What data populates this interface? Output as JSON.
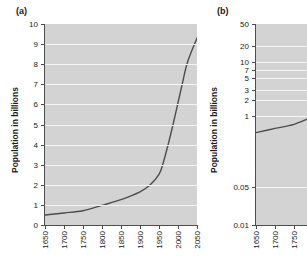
{
  "figure": {
    "panels": [
      {
        "key": "a",
        "label": "(a)",
        "ylabel": "Population in billions",
        "yscale": "linear"
      },
      {
        "key": "b",
        "label": "(b)",
        "ylabel": "Population in billions",
        "yscale": "log"
      }
    ]
  },
  "chart_data": [
    {
      "type": "line",
      "panel": "a",
      "title": "",
      "xlabel": "",
      "ylabel": "Population in billions",
      "xscale": "linear",
      "yscale": "linear",
      "xlim": [
        1650,
        2050
      ],
      "ylim": [
        0,
        10
      ],
      "xticks": [
        1650,
        1700,
        1750,
        1800,
        1850,
        1900,
        1950,
        2000,
        2050
      ],
      "xticklabels": [
        "1650",
        "1700",
        "1750",
        "1800",
        "1850",
        "1900",
        "1950",
        "2000",
        "2050"
      ],
      "yticks": [
        0,
        1,
        2,
        3,
        4,
        5,
        6,
        7,
        8,
        9,
        10
      ],
      "yticklabels": [
        "0",
        "1",
        "2",
        "3",
        "4",
        "5",
        "6",
        "7",
        "8",
        "9",
        "10"
      ],
      "grid": true,
      "grid_axis": "y",
      "legend": null,
      "series": [
        {
          "name": "World population",
          "color": "#4d4d4d",
          "x": [
            1650,
            1700,
            1750,
            1800,
            1850,
            1900,
            1927,
            1950,
            1960,
            1974,
            1987,
            1999,
            2011,
            2025,
            2050
          ],
          "y": [
            0.5,
            0.6,
            0.71,
            0.98,
            1.26,
            1.65,
            2.0,
            2.52,
            3.02,
            4.0,
            5.0,
            6.0,
            7.0,
            8.1,
            9.3
          ]
        }
      ]
    },
    {
      "type": "line",
      "panel": "b",
      "title": "",
      "xlabel": "",
      "ylabel": "Population in billions",
      "xscale": "linear",
      "yscale": "log",
      "xlim": [
        1650,
        2050
      ],
      "ylim": [
        0.01,
        50
      ],
      "xticks": [
        1650,
        1700,
        1750,
        1800,
        1850,
        1900,
        1950,
        2000,
        2050
      ],
      "xticklabels": [
        "1650",
        "1700",
        "1750",
        "1800",
        "1850",
        "1900",
        "1950",
        "2000",
        "2050"
      ],
      "yticks": [
        50,
        20,
        10,
        7,
        5,
        3,
        2,
        1,
        0.05,
        0.01
      ],
      "yticklabels": [
        "50",
        "20",
        "10",
        "7",
        "5",
        "3",
        "2",
        "1",
        "0.05",
        "0.01"
      ],
      "grid": true,
      "grid_axis": "y",
      "legend": null,
      "note": "panel is cropped at the right edge of the image",
      "series": [
        {
          "name": "World population",
          "color": "#4d4d4d",
          "x": [
            1650,
            1700,
            1750,
            1800,
            1850,
            1900,
            1927,
            1950,
            1960,
            1974,
            1987,
            1999,
            2011,
            2025,
            2050
          ],
          "y": [
            0.5,
            0.6,
            0.71,
            0.98,
            1.26,
            1.65,
            2.0,
            2.52,
            3.02,
            4.0,
            5.0,
            6.0,
            7.0,
            8.1,
            9.3
          ]
        }
      ]
    }
  ]
}
